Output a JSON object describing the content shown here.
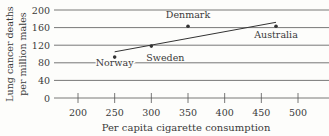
{
  "chart_data": {
    "type": "scatter",
    "title": "",
    "xlabel": "Per capita cigarette consumption",
    "ylabel": "Lung cancer deaths per million males",
    "ylabel_lines": [
      "Lung cancer deaths",
      "per million males"
    ],
    "x_ticks": [
      200,
      250,
      300,
      350,
      400,
      450,
      500
    ],
    "y_ticks": [
      0,
      40,
      80,
      120,
      160,
      200
    ],
    "xlim": [
      170,
      510
    ],
    "ylim": [
      0,
      200
    ],
    "grid": "horizontal",
    "points": [
      {
        "label": "Norway",
        "x": 250,
        "y": 93
      },
      {
        "label": "Sweden",
        "x": 300,
        "y": 118
      },
      {
        "label": "Denmark",
        "x": 350,
        "y": 163
      },
      {
        "label": "Australia",
        "x": 470,
        "y": 163
      }
    ],
    "trend_line": {
      "x0": 250,
      "y0": 105,
      "x1": 470,
      "y1": 172
    }
  }
}
